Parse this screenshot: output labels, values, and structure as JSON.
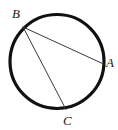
{
  "figure": {
    "background_color": "#ffffff",
    "stroke_color": "#111111",
    "chord_color": "#3a3a3a",
    "label_color": "#1a1a1a"
  },
  "circle": {
    "name": "circle-outline",
    "center_x": 57,
    "center_y": 61.5,
    "radius": 47,
    "stroke_width": 3.2
  },
  "points": [
    {
      "id": "B",
      "label": "B",
      "x": 23,
      "y": 27,
      "label_x": 12,
      "label_y": 7
    },
    {
      "id": "A",
      "label": "A",
      "x": 103.5,
      "y": 64,
      "label_x": 106,
      "label_y": 56
    },
    {
      "id": "C",
      "label": "C",
      "x": 66,
      "y": 109.5,
      "label_x": 63,
      "label_y": 114
    }
  ],
  "chords": [
    {
      "id": "BA",
      "from": "B",
      "to": "A",
      "x1": 23,
      "y1": 27,
      "x2": 103.5,
      "y2": 64,
      "stroke_width": 1
    },
    {
      "id": "BC",
      "from": "B",
      "to": "C",
      "x1": 23,
      "y1": 27,
      "x2": 66,
      "y2": 109.5,
      "stroke_width": 1
    }
  ],
  "labels": {
    "B": "B",
    "A": "A",
    "C": "C"
  }
}
